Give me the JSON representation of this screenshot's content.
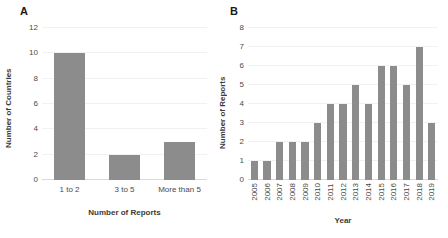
{
  "figure": {
    "panels": [
      {
        "letter": "A",
        "chart_data": {
          "type": "bar",
          "title": "",
          "categories": [
            "1 to 2",
            "3 to 5",
            "More than 5"
          ],
          "values": [
            10,
            2,
            3
          ],
          "xlabel": "Number of Reports",
          "ylabel": "Number of Countries",
          "ylim": [
            0,
            12
          ],
          "yticks": [
            0,
            2,
            4,
            6,
            8,
            10,
            12
          ],
          "grid": true,
          "legend": "none",
          "bar_color": "#8c8c8c"
        }
      },
      {
        "letter": "B",
        "chart_data": {
          "type": "bar",
          "title": "",
          "categories": [
            "2005",
            "2006",
            "2007",
            "2008",
            "2009",
            "2010",
            "2011",
            "2012",
            "2013",
            "2014",
            "2015",
            "2016",
            "2017",
            "2018",
            "2019"
          ],
          "values": [
            1,
            1,
            2,
            2,
            2,
            3,
            4,
            4,
            5,
            4,
            6,
            6,
            5,
            7,
            3
          ],
          "xlabel": "Year",
          "ylabel": "Number of Reports",
          "ylim": [
            0,
            8
          ],
          "yticks": [
            0,
            1,
            2,
            3,
            4,
            5,
            6,
            7,
            8
          ],
          "grid": true,
          "legend": "none",
          "bar_color": "#8c8c8c"
        }
      }
    ]
  }
}
